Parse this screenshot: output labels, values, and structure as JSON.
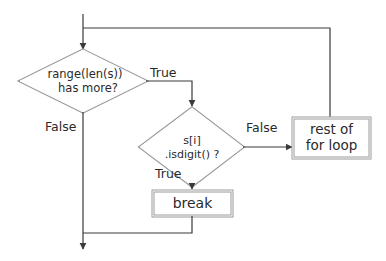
{
  "diagram": {
    "type": "flowchart",
    "colors": {
      "line": "#3a3a3a",
      "shape_border": "#8a8a8a",
      "text": "#2a2a2a",
      "background": "#ffffff"
    },
    "nodes": [
      {
        "id": "cond_range",
        "shape": "diamond",
        "lines": [
          "range(len(s))",
          "has more?"
        ]
      },
      {
        "id": "cond_isdigit",
        "shape": "diamond",
        "lines": [
          "s[i]",
          ".isdigit() ?"
        ]
      },
      {
        "id": "break",
        "shape": "rectangle",
        "label": "break"
      },
      {
        "id": "rest",
        "shape": "rectangle",
        "lines": [
          "rest of",
          "for loop"
        ]
      }
    ],
    "edges": [
      {
        "from": "entry",
        "to": "cond_range",
        "label": ""
      },
      {
        "from": "cond_range",
        "to": "cond_isdigit",
        "label": "True"
      },
      {
        "from": "cond_range",
        "to": "exit",
        "label": "False"
      },
      {
        "from": "cond_isdigit",
        "to": "rest",
        "label": "False"
      },
      {
        "from": "cond_isdigit",
        "to": "break",
        "label": "True"
      },
      {
        "from": "break",
        "to": "exit",
        "label": ""
      },
      {
        "from": "rest",
        "to": "cond_range",
        "label": ""
      }
    ],
    "labels": {
      "true_1": "True",
      "false_1": "False",
      "false_2": "False",
      "true_2": "True"
    }
  }
}
